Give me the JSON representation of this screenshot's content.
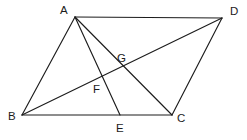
{
  "figure": {
    "canvas": {
      "width": 247,
      "height": 140
    },
    "background_color": "#ffffff",
    "stroke_color": "#1c1c1c",
    "label_color": "#1c1c1c",
    "points": [
      {
        "id": "A",
        "label": "A",
        "x": 75,
        "y": 17,
        "label_x": 60,
        "label_y": 14
      },
      {
        "id": "D",
        "label": "D",
        "x": 222,
        "y": 18,
        "label_x": 230,
        "label_y": 15
      },
      {
        "id": "B",
        "label": "B",
        "x": 22,
        "y": 115,
        "label_x": 8,
        "label_y": 120
      },
      {
        "id": "C",
        "label": "C",
        "x": 172,
        "y": 115,
        "label_x": 177,
        "label_y": 122
      },
      {
        "id": "E",
        "label": "E",
        "x": 120,
        "y": 115,
        "label_x": 116,
        "label_y": 132
      },
      {
        "id": "F",
        "label": "F",
        "x": 106,
        "y": 81,
        "label_x": 93,
        "label_y": 93
      },
      {
        "id": "G",
        "label": "G",
        "x": 124,
        "y": 67,
        "label_x": 117,
        "label_y": 62
      }
    ],
    "segments": [
      {
        "name": "side-AD",
        "from": "A",
        "to": "D"
      },
      {
        "name": "side-AB",
        "from": "A",
        "to": "B"
      },
      {
        "name": "side-BC",
        "from": "B",
        "to": "C"
      },
      {
        "name": "side-DC",
        "from": "D",
        "to": "C"
      },
      {
        "name": "diagonal-BD",
        "from": "B",
        "to": "D"
      },
      {
        "name": "diagonal-AC",
        "from": "A",
        "to": "C"
      },
      {
        "name": "cevian-AE",
        "from": "A",
        "to": "E"
      }
    ],
    "intersections": [
      {
        "name": "F",
        "of": [
          "cevian-AE",
          "diagonal-BD"
        ]
      },
      {
        "name": "G",
        "of": [
          "diagonal-AC",
          "diagonal-BD"
        ]
      }
    ]
  }
}
